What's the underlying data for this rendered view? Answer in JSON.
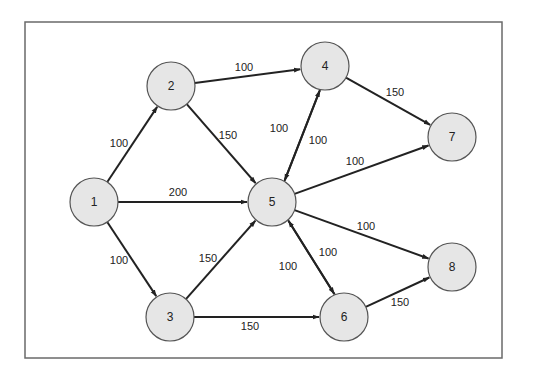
{
  "diagram": {
    "type": "directed-weighted-network",
    "frame": {
      "x": 25,
      "y": 22,
      "width": 477,
      "height": 336
    },
    "node_radius": 24,
    "nodes": [
      {
        "id": "1",
        "label": "1",
        "x": 94,
        "y": 202
      },
      {
        "id": "2",
        "label": "2",
        "x": 171,
        "y": 86
      },
      {
        "id": "3",
        "label": "3",
        "x": 170,
        "y": 317
      },
      {
        "id": "4",
        "label": "4",
        "x": 325,
        "y": 66
      },
      {
        "id": "5",
        "label": "5",
        "x": 272,
        "y": 202
      },
      {
        "id": "6",
        "label": "6",
        "x": 344,
        "y": 317
      },
      {
        "id": "7",
        "label": "7",
        "x": 452,
        "y": 137
      },
      {
        "id": "8",
        "label": "8",
        "x": 452,
        "y": 267
      }
    ],
    "edges": [
      {
        "from": "1",
        "to": "2",
        "weight": "100",
        "label_x": 119,
        "label_y": 143
      },
      {
        "from": "1",
        "to": "5",
        "weight": "200",
        "label_x": 178,
        "label_y": 192
      },
      {
        "from": "1",
        "to": "3",
        "weight": "100",
        "label_x": 119,
        "label_y": 260
      },
      {
        "from": "2",
        "to": "4",
        "weight": "100",
        "label_x": 244,
        "label_y": 67
      },
      {
        "from": "2",
        "to": "5",
        "weight": "150",
        "label_x": 228,
        "label_y": 135
      },
      {
        "from": "3",
        "to": "5",
        "weight": "150",
        "label_x": 208,
        "label_y": 258
      },
      {
        "from": "3",
        "to": "6",
        "weight": "150",
        "label_x": 250,
        "label_y": 326
      },
      {
        "from": "4",
        "to": "5",
        "weight": "100",
        "label_x": 279,
        "label_y": 128,
        "offset": -4
      },
      {
        "from": "5",
        "to": "4",
        "weight": "100",
        "label_x": 318,
        "label_y": 140,
        "offset": 4
      },
      {
        "from": "4",
        "to": "7",
        "weight": "150",
        "label_x": 395,
        "label_y": 92
      },
      {
        "from": "5",
        "to": "7",
        "weight": "100",
        "label_x": 355,
        "label_y": 161
      },
      {
        "from": "5",
        "to": "8",
        "weight": "100",
        "label_x": 366,
        "label_y": 226
      },
      {
        "from": "5",
        "to": "6",
        "weight": "100",
        "label_x": 288,
        "label_y": 266,
        "offset": -4
      },
      {
        "from": "6",
        "to": "5",
        "weight": "100",
        "label_x": 328,
        "label_y": 252,
        "offset": 4
      },
      {
        "from": "6",
        "to": "8",
        "weight": "150",
        "label_x": 400,
        "label_y": 302
      }
    ]
  }
}
